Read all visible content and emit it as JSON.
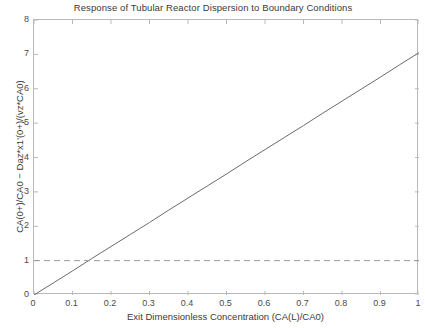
{
  "chart_data": {
    "type": "line",
    "title": "Response of Tubular Reactor Dispersion to Boundary Conditions",
    "xlabel": "Exit Dimensionless Concentration (CA(L)/CA0)",
    "ylabel": "CA(0+)/CA0 − Daz*x1'(0+)/(vz*CA0)",
    "xlim": [
      0,
      1
    ],
    "ylim": [
      0,
      8
    ],
    "xticks": [
      "0",
      "0.1",
      "0.2",
      "0.3",
      "0.4",
      "0.5",
      "0.6",
      "0.7",
      "0.8",
      "0.9",
      "1"
    ],
    "xtick_values": [
      0,
      0.1,
      0.2,
      0.3,
      0.4,
      0.5,
      0.6,
      0.7,
      0.8,
      0.9,
      1
    ],
    "yticks": [
      "0",
      "1",
      "2",
      "3",
      "4",
      "5",
      "6",
      "7",
      "8"
    ],
    "ytick_values": [
      0,
      1,
      2,
      3,
      4,
      5,
      6,
      7,
      8
    ],
    "grid": false,
    "legend": null,
    "series": [
      {
        "name": "inlet-boundary-response",
        "style": "solid",
        "color": "#6b6b6b",
        "x": [
          0,
          0.05,
          0.1,
          0.15,
          0.2,
          0.25,
          0.3,
          0.35,
          0.4,
          0.45,
          0.5,
          0.55,
          0.6,
          0.65,
          0.7,
          0.75,
          0.8,
          0.85,
          0.9,
          0.95,
          1
        ],
        "values": [
          0,
          0.35,
          0.7,
          1.06,
          1.41,
          1.76,
          2.11,
          2.47,
          2.82,
          3.17,
          3.52,
          3.88,
          4.23,
          4.58,
          4.93,
          5.29,
          5.64,
          5.99,
          6.34,
          6.7,
          7.05
        ]
      },
      {
        "name": "unity-reference-line",
        "style": "dashed",
        "color": "#9a9a9a",
        "x": [
          0,
          1
        ],
        "values": [
          1,
          1
        ]
      }
    ],
    "annotations": [],
    "intersection_note": "solid line crosses reference line y=1 near x=0.14"
  }
}
